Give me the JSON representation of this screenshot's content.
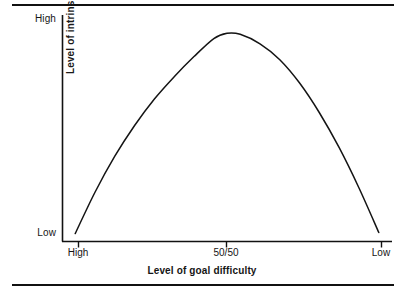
{
  "figure": {
    "background_color": "#ffffff",
    "ink_color": "#111111",
    "has_top_rule": true,
    "has_bottom_rule": true
  },
  "axes": {
    "y_title": "Level of intrinsic motivation",
    "y_tick_top": "High",
    "y_tick_bottom": "Low",
    "x_title": "Level of goal difficulty",
    "x_tick_left": "High",
    "x_tick_mid": "50/50",
    "x_tick_right": "Low"
  },
  "chart_data": {
    "type": "line",
    "title": "",
    "subtitle": "",
    "xlabel": "Level of goal difficulty",
    "ylabel": "Level of intrinsic motivation",
    "xlim": [
      0,
      1
    ],
    "ylim": [
      0,
      1
    ],
    "grid": false,
    "legend": false,
    "legend_position": "none",
    "x_tick_labels": [
      "High",
      "50/50",
      "Low"
    ],
    "x_tick_positions": [
      0.05,
      0.5,
      0.97
    ],
    "y_tick_labels": [
      "Low",
      "High"
    ],
    "y_tick_positions": [
      0.0,
      1.0
    ],
    "annotations": [],
    "series": [
      {
        "name": "Intrinsic motivation vs goal difficulty",
        "shape": "inverted-u parabola",
        "x": [
          0.04,
          0.1,
          0.16,
          0.22,
          0.28,
          0.34,
          0.4,
          0.46,
          0.5,
          0.54,
          0.6,
          0.66,
          0.72,
          0.78,
          0.84,
          0.9,
          0.96
        ],
        "y": [
          0.035,
          0.23,
          0.4,
          0.545,
          0.67,
          0.775,
          0.87,
          0.955,
          0.98,
          0.975,
          0.93,
          0.855,
          0.745,
          0.605,
          0.44,
          0.25,
          0.04
        ]
      }
    ]
  }
}
